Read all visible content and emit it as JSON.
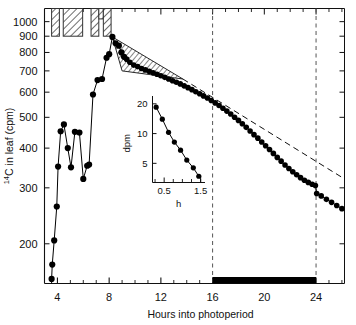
{
  "figure": {
    "axis_color": "#111111",
    "data_color": "#000000",
    "dark_bar_color": "#000000"
  },
  "chart_data": {
    "type": "line",
    "title": "",
    "xlabel": "Hours into photoperiod",
    "ylabel": "14C in leaf (cpm)",
    "ylabel_sup": "14",
    "ylabel_rest": "C in leaf (cpm)",
    "yscale": "log",
    "ylim": [
      150,
      1100
    ],
    "xlim": [
      3.0,
      26.2
    ],
    "xticks": [
      4,
      8,
      12,
      16,
      20,
      24
    ],
    "xticklabels": [
      "4",
      "8",
      "12",
      "16",
      "20",
      "24"
    ],
    "xminorticks": [
      5,
      6,
      7,
      9,
      10,
      11,
      13,
      14,
      15,
      17,
      18,
      19,
      21,
      22,
      23,
      25,
      26
    ],
    "yticks": [
      200,
      300,
      400,
      500,
      600,
      700,
      800,
      900,
      1000
    ],
    "yticklabels": [
      "200",
      "300",
      "400",
      "500",
      "600",
      "700",
      "800",
      "900",
      "1000"
    ],
    "grid": false,
    "legend": null,
    "series": [
      {
        "name": "14C in leaf",
        "marker": "filled-circle",
        "x": [
          3.55,
          3.6,
          3.75,
          3.95,
          4.05,
          4.25,
          4.5,
          4.8,
          5.05,
          5.35,
          5.7,
          6.0,
          6.3,
          6.45,
          6.75,
          7.1,
          7.45,
          7.8,
          8.0,
          8.25,
          8.5,
          8.75,
          8.95,
          9.15,
          9.35,
          9.6,
          9.9,
          10.2,
          10.5,
          10.8,
          11.1,
          11.4,
          11.7,
          12.0,
          12.3,
          12.6,
          12.9,
          13.2,
          13.5,
          13.8,
          14.1,
          14.4,
          14.7,
          15.0,
          15.3,
          15.6,
          15.9,
          16.2,
          16.5,
          16.8,
          17.1,
          17.4,
          17.7,
          18.0,
          18.3,
          18.6,
          18.9,
          19.2,
          19.5,
          19.8,
          20.1,
          20.4,
          20.7,
          21.0,
          21.3,
          21.6,
          21.9,
          22.2,
          22.5,
          22.8,
          23.1,
          23.4,
          23.7,
          23.95,
          24.05,
          24.4,
          24.8,
          25.2,
          25.6,
          26.0
        ],
        "y": [
          155,
          172,
          205,
          262,
          350,
          452,
          475,
          400,
          348,
          450,
          448,
          320,
          352,
          355,
          590,
          655,
          660,
          770,
          790,
          895,
          855,
          840,
          800,
          775,
          762,
          745,
          730,
          722,
          712,
          705,
          698,
          690,
          683,
          676,
          668,
          660,
          652,
          645,
          637,
          628,
          620,
          611,
          602,
          593,
          584,
          575,
          565,
          555,
          545,
          534,
          523,
          512,
          500,
          489,
          477,
          465,
          453,
          441,
          430,
          418,
          407,
          396,
          385,
          374,
          364,
          354,
          345,
          337,
          330,
          323,
          317,
          312,
          308,
          305,
          288,
          283,
          276,
          270,
          264,
          258
        ]
      }
    ],
    "extrapolation_line": {
      "style": "dashed",
      "x": [
        13.7,
        26.2
      ],
      "y": [
        660,
        320
      ],
      "note": "dashed straight extrapolation of the slow decay phase"
    },
    "vertical_markers": [
      {
        "x": 16,
        "style": "dashed"
      },
      {
        "x": 24,
        "style": "dashed"
      }
    ],
    "hatched_wedge": {
      "note": "hatched triangular area between peak decline and extrapolated line",
      "vertices_x": [
        8.25,
        9.0,
        13.7
      ],
      "vertices_y": [
        895,
        700,
        660
      ]
    },
    "light_bars": {
      "note": "hatched bars at top of plot indicating 14CO2 labelling pulses",
      "fill": "hatch",
      "bars": [
        {
          "x0": 3.55,
          "x1": 4.15,
          "y_top": 1100,
          "y_bottom": 900
        },
        {
          "x0": 4.45,
          "x1": 5.95,
          "y_top": 1100,
          "y_bottom": 900
        },
        {
          "x0": 6.6,
          "x1": 7.2,
          "y_top": 1100,
          "y_bottom": 900
        },
        {
          "x0": 7.2,
          "x1": 7.55,
          "y_top": 1100,
          "y_bottom": 1020
        },
        {
          "x0": 7.55,
          "x1": 8.15,
          "y_top": 1100,
          "y_bottom": 900
        }
      ]
    },
    "dark_bar": {
      "note": "solid black bar along x-axis marking the dark period",
      "x0": 16,
      "x1": 24
    },
    "inset": {
      "type": "line",
      "xlabel": "h",
      "ylabel": "dpm",
      "yscale": "log",
      "xticks": [
        0.5,
        1.5
      ],
      "xticklabels": [
        "0.5",
        "1.5"
      ],
      "xminorticks": [
        0.25,
        0.75,
        1.0,
        1.25,
        1.5
      ],
      "yticks": [
        5,
        10,
        20
      ],
      "yticklabels": [
        "5",
        "10",
        "20"
      ],
      "xlim": [
        0.18,
        1.62
      ],
      "ylim": [
        3.2,
        24
      ],
      "marker": "filled-circle",
      "x": [
        0.28,
        0.45,
        0.62,
        0.78,
        0.95,
        1.12,
        1.3,
        1.45
      ],
      "y": [
        18.5,
        14.0,
        10.3,
        8.2,
        6.8,
        5.4,
        4.5,
        3.7
      ]
    }
  }
}
